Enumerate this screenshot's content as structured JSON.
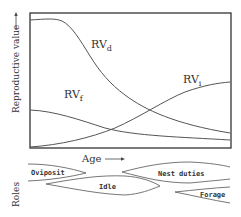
{
  "diagram": {
    "y_axis_label": "Reproductive value",
    "x_axis_label": "Age",
    "roles_label": "Roles",
    "curves": [
      {
        "id": "RVd",
        "label": "RV",
        "subscript": "d"
      },
      {
        "id": "RVf",
        "label": "RV",
        "subscript": "f"
      },
      {
        "id": "RVi",
        "label": "RV",
        "subscript": "i"
      }
    ],
    "roles": [
      {
        "id": "oviposit",
        "label": "Oviposit"
      },
      {
        "id": "idle",
        "label": "Idle"
      },
      {
        "id": "nest",
        "label": "Nest duties"
      },
      {
        "id": "forage",
        "label": "Forage"
      }
    ],
    "colors": {
      "line": "#555555",
      "text": "#333333",
      "background": "#ffffff"
    }
  }
}
